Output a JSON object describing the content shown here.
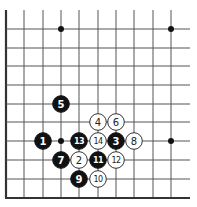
{
  "diagram": {
    "type": "go-board-partial",
    "colors": {
      "background": "#ffffff",
      "line": "#555555",
      "black": "#111111",
      "white": "#ffffff"
    },
    "grid": {
      "x_lines": [
        6,
        24,
        43,
        61,
        79,
        98,
        116,
        134,
        153,
        171
      ],
      "y_lines": [
        29,
        48,
        66,
        85,
        104,
        122,
        141,
        160,
        179
      ],
      "x_extent": [
        6,
        190
      ],
      "y_extent": [
        10,
        198
      ],
      "left_edge_x": 6,
      "bottom_edge_y": 198
    },
    "star_points": [
      {
        "x": 61,
        "y": 29
      },
      {
        "x": 171,
        "y": 29
      },
      {
        "x": 61,
        "y": 141
      },
      {
        "x": 171,
        "y": 141
      }
    ],
    "stones": [
      {
        "move": "1",
        "color": "black",
        "x": 43,
        "y": 141
      },
      {
        "move": "2",
        "color": "white",
        "x": 79,
        "y": 160
      },
      {
        "move": "3",
        "color": "black",
        "x": 116,
        "y": 141
      },
      {
        "move": "4",
        "color": "white",
        "x": 98,
        "y": 122
      },
      {
        "move": "5",
        "color": "black",
        "x": 61,
        "y": 104
      },
      {
        "move": "6",
        "color": "white",
        "x": 116,
        "y": 122
      },
      {
        "move": "7",
        "color": "black",
        "x": 61,
        "y": 160
      },
      {
        "move": "8",
        "color": "white",
        "x": 134,
        "y": 141
      },
      {
        "move": "9",
        "color": "black",
        "x": 79,
        "y": 179
      },
      {
        "move": "10",
        "color": "white",
        "x": 98,
        "y": 179
      },
      {
        "move": "11",
        "color": "black",
        "x": 98,
        "y": 160
      },
      {
        "move": "12",
        "color": "white",
        "x": 116,
        "y": 160
      },
      {
        "move": "13",
        "color": "black",
        "x": 79,
        "y": 141
      },
      {
        "move": "14",
        "color": "white",
        "x": 98,
        "y": 141
      }
    ],
    "stone_radius": 8.3
  }
}
